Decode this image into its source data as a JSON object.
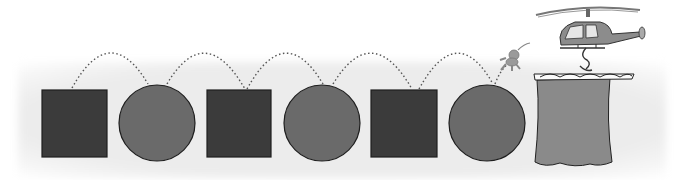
{
  "scene": {
    "description": "Alternating squares and circles connected by dotted jump arcs, with a small character leaping toward a curtain-bucket suspended from a helicopter",
    "colors": {
      "square": "#3b3b3b",
      "circle": "#6a6a6a",
      "outline": "#1e1e1e",
      "curtain": "#8a8a8a",
      "background_band": "#ececec",
      "dots": "#555555"
    },
    "shapes": [
      {
        "type": "square",
        "x": 42,
        "y": 90,
        "w": 65,
        "h": 67
      },
      {
        "type": "circle",
        "cx": 157,
        "cy": 123,
        "r": 38
      },
      {
        "type": "square",
        "x": 207,
        "y": 90,
        "w": 64,
        "h": 67
      },
      {
        "type": "circle",
        "cx": 322,
        "cy": 123,
        "r": 38
      },
      {
        "type": "square",
        "x": 371,
        "y": 90,
        "w": 66,
        "h": 67
      },
      {
        "type": "circle",
        "cx": 487,
        "cy": 123,
        "r": 38
      }
    ],
    "sequence": [
      "square",
      "circle",
      "square",
      "circle",
      "square",
      "circle",
      "curtain-bucket"
    ],
    "character_icon": "jumping-figure",
    "vehicle_icon": "helicopter",
    "container_icon": "curtain-bucket"
  }
}
